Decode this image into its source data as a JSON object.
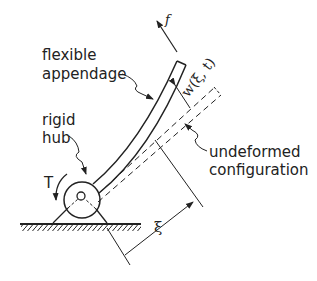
{
  "diagram": {
    "labels": {
      "flexible_appendage_line1": "flexible",
      "flexible_appendage_line2": "appendage",
      "rigid_hub_line1": "rigid",
      "rigid_hub_line2": "hub",
      "torque": "T",
      "force": "f",
      "deflection": "w(ξ, t)",
      "undeformed_line1": "undeformed",
      "undeformed_line2": "configuration",
      "position": "ξ"
    },
    "colors": {
      "stroke": "#222222",
      "background": "#ffffff"
    }
  }
}
